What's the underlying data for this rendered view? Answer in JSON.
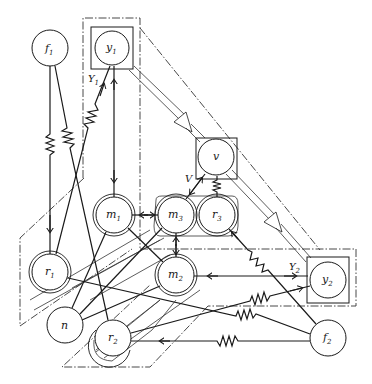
{
  "diagram": {
    "type": "network-graph",
    "nodes": [
      {
        "id": "f1",
        "base": "f",
        "sub": "1",
        "x": 50,
        "y": 48,
        "style": "circle"
      },
      {
        "id": "y1",
        "base": "y",
        "sub": "1",
        "x": 112,
        "y": 48,
        "style": "boxed-circle"
      },
      {
        "id": "v",
        "base": "v",
        "sub": "",
        "x": 216,
        "y": 158,
        "style": "boxed-circle"
      },
      {
        "id": "m1",
        "base": "m",
        "sub": "1",
        "x": 114,
        "y": 215,
        "style": "double-circle"
      },
      {
        "id": "m3",
        "base": "m",
        "sub": "3",
        "x": 176,
        "y": 215,
        "style": "double-circle"
      },
      {
        "id": "r3",
        "base": "r",
        "sub": "3",
        "x": 217,
        "y": 215,
        "style": "double-circle"
      },
      {
        "id": "r1",
        "base": "r",
        "sub": "1",
        "x": 50,
        "y": 272,
        "style": "double-circle"
      },
      {
        "id": "m2",
        "base": "m",
        "sub": "2",
        "x": 176,
        "y": 275,
        "style": "double-circle"
      },
      {
        "id": "y2",
        "base": "y",
        "sub": "2",
        "x": 326,
        "y": 280,
        "style": "boxed-circle"
      },
      {
        "id": "n",
        "base": "n",
        "sub": "",
        "x": 65,
        "y": 325,
        "style": "circle"
      },
      {
        "id": "r2",
        "base": "r",
        "sub": "2",
        "x": 113,
        "y": 338,
        "style": "double-circle"
      },
      {
        "id": "f2",
        "base": "f",
        "sub": "2",
        "x": 328,
        "y": 338,
        "style": "circle"
      }
    ],
    "region_labels": [
      {
        "id": "Y1",
        "base": "Y",
        "sub": "1",
        "x": 90,
        "y": 82
      },
      {
        "id": "V",
        "base": "V",
        "sub": "",
        "x": 187,
        "y": 180
      },
      {
        "id": "Y2",
        "base": "Y",
        "sub": "2",
        "x": 291,
        "y": 267
      }
    ],
    "edges": [
      {
        "from": "f1",
        "to": "r1",
        "kind": "spring",
        "arrow": "to"
      },
      {
        "from": "f1",
        "to": "r2",
        "kind": "spring"
      },
      {
        "from": "r1",
        "to": "y1",
        "kind": "spring",
        "arrow": "to"
      },
      {
        "from": "y1",
        "to": "m1",
        "kind": "line",
        "arrow": "both"
      },
      {
        "from": "m1",
        "to": "m3",
        "kind": "line",
        "arrow": "both"
      },
      {
        "from": "m3",
        "to": "v",
        "kind": "line",
        "arrow": "both"
      },
      {
        "from": "v",
        "to": "r3",
        "kind": "spring"
      },
      {
        "from": "m3",
        "to": "m2",
        "kind": "line",
        "arrow": "both"
      },
      {
        "from": "m1",
        "to": "m2",
        "kind": "line"
      },
      {
        "from": "y2",
        "to": "m2",
        "kind": "line",
        "arrow": "both"
      },
      {
        "from": "f2",
        "to": "r3",
        "kind": "spring",
        "arrow": "to"
      },
      {
        "from": "r2",
        "to": "y2",
        "kind": "spring",
        "arrow": "to"
      },
      {
        "from": "r1",
        "to": "f2",
        "kind": "spring"
      },
      {
        "from": "f2",
        "to": "r2",
        "kind": "spring",
        "arrow": "to"
      },
      {
        "from": "n",
        "to": "m1",
        "kind": "line",
        "arrow": "to"
      },
      {
        "from": "n",
        "to": "m3",
        "kind": "line",
        "arrow": "to"
      },
      {
        "from": "n",
        "to": "m2",
        "kind": "line",
        "arrow": "to"
      },
      {
        "from": "y1",
        "to": "v",
        "kind": "double-arrow"
      },
      {
        "from": "v",
        "to": "y2",
        "kind": "double-arrow"
      }
    ],
    "caption": ""
  }
}
